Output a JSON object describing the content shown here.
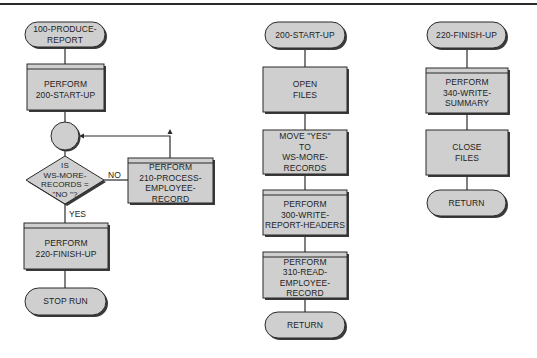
{
  "diagram": {
    "type": "flowchart",
    "colors": {
      "fill": "#cfcfcf",
      "stroke": "#2a2a2a",
      "background": "#ffffff"
    },
    "main": {
      "start": [
        "100-PRODUCE-",
        "REPORT"
      ],
      "perform_start": [
        "PERFORM",
        "200-START-UP"
      ],
      "decision": [
        "IS",
        "WS-MORE-",
        "RECORDS =",
        "\"NO \"?"
      ],
      "no_label": "NO",
      "yes_label": "YES",
      "perform_process": [
        "PERFORM",
        "210-PROCESS-",
        "EMPLOYEE-",
        "RECORD"
      ],
      "perform_finish": [
        "PERFORM",
        "220-FINISH-UP"
      ],
      "end": [
        "STOP RUN"
      ]
    },
    "start_up": {
      "start": [
        "200-START-UP"
      ],
      "open": [
        "OPEN",
        "FILES"
      ],
      "move": [
        "MOVE \"YES\"",
        "TO",
        "WS-MORE-",
        "RECORDS"
      ],
      "perform_headers": [
        "PERFORM",
        "300-WRITE-",
        "REPORT-HEADERS"
      ],
      "perform_read": [
        "PERFORM",
        "310-READ-",
        "EMPLOYEE-",
        "RECORD"
      ],
      "end": [
        "RETURN"
      ]
    },
    "finish_up": {
      "start": [
        "220-FINISH-UP"
      ],
      "perform_summary": [
        "PERFORM",
        "340-WRITE-",
        "SUMMARY"
      ],
      "close": [
        "CLOSE",
        "FILES"
      ],
      "end": [
        "RETURN"
      ]
    }
  }
}
